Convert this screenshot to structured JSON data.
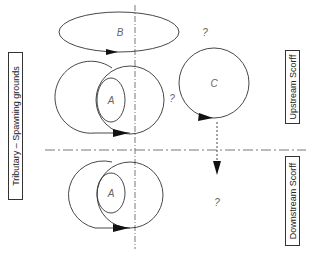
{
  "labels": {
    "left": "Tributary – Spawning grounds",
    "upstream": "Upstream Scorff",
    "downstream": "Downstream Scorff"
  },
  "regions": {
    "b": "B",
    "a_upper": "A",
    "a_lower": "A",
    "c": "C"
  },
  "questions": {
    "q1": "?",
    "q2": "?",
    "q3": "?"
  },
  "colors": {
    "stroke": "#333333",
    "text": "#666666"
  }
}
